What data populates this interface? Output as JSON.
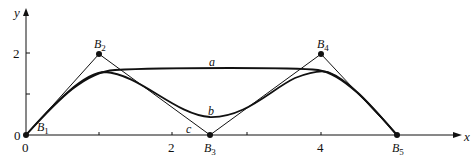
{
  "figure": {
    "type": "B-spline control polygon with curves",
    "axes": {
      "x_label": "x",
      "y_label": "y",
      "x_ticks": [
        "0",
        "2",
        "4"
      ],
      "y_ticks": [
        "0",
        "2"
      ],
      "x_range": [
        0,
        6
      ],
      "y_range": [
        0,
        3
      ]
    },
    "control_points": [
      {
        "label": "B",
        "sub": "1",
        "x": 0,
        "y": 0
      },
      {
        "label": "B",
        "sub": "2",
        "x": 1,
        "y": 2
      },
      {
        "label": "B",
        "sub": "3",
        "x": 2.5,
        "y": 0
      },
      {
        "label": "B",
        "sub": "4",
        "x": 4,
        "y": 2
      },
      {
        "label": "B",
        "sub": "5",
        "x": 5,
        "y": 0
      }
    ],
    "curves": [
      {
        "label": "a",
        "description": "upper curve"
      },
      {
        "label": "b",
        "description": "middle curve"
      },
      {
        "label": "c",
        "description": "lower curve near polygon"
      }
    ],
    "colors": {
      "line": "#111111",
      "background": "#ffffff"
    }
  }
}
